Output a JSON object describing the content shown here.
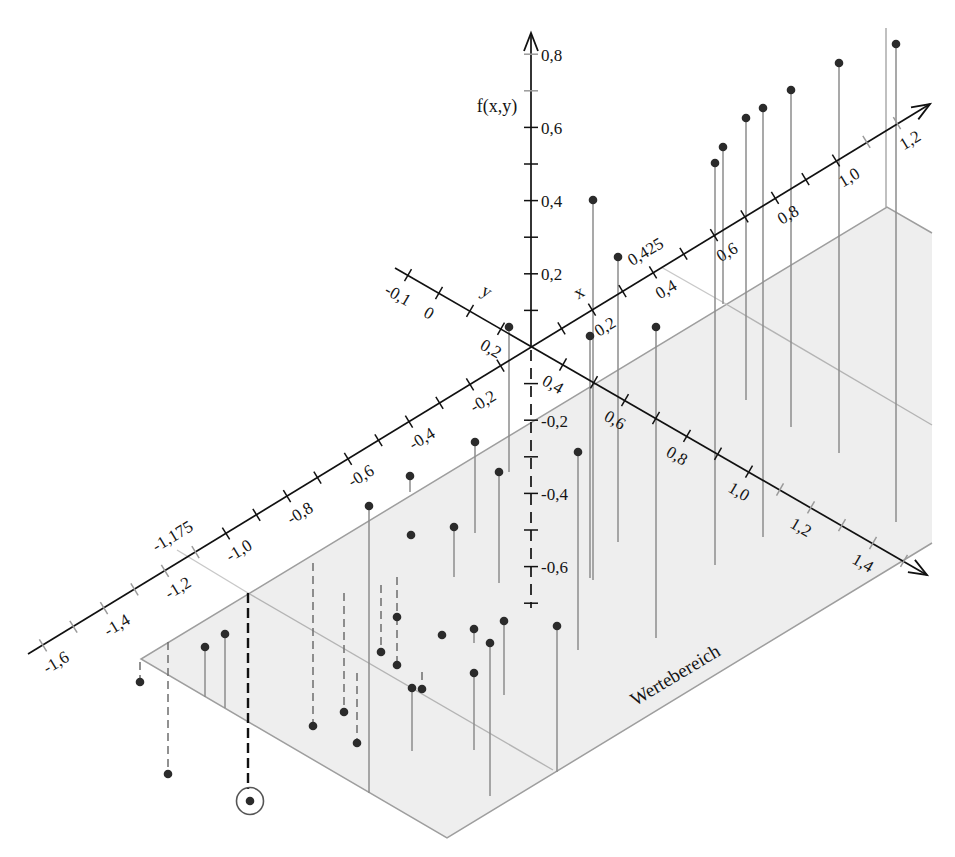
{
  "colors": {
    "background": "#ffffff",
    "plane_fill": "#eeeeee",
    "plane_edge": "#9e9e9e",
    "domain_line": "#b4b4b4",
    "stem": "#8c8c8c",
    "stem_dashed": "#6e6e6e",
    "highlight_stem": "#111111",
    "dot": "#2b2b2b",
    "axis": "#111111",
    "tick_minor": "#9a9a9a",
    "highlight_ring": "#555555"
  },
  "chart_data": {
    "type": "scatter",
    "subtype": "3d-stem",
    "title": "",
    "xlabel": "x",
    "ylabel": "y",
    "zlabel": "f(x,y)",
    "grid": false,
    "legend": null,
    "axes": {
      "x": {
        "label": "x",
        "range": [
          -1.6,
          1.2
        ],
        "tick_step": 0.1,
        "labels": [
          {
            "v": -1.6,
            "t": "-1,6"
          },
          {
            "v": -1.4,
            "t": "-1,4"
          },
          {
            "v": -1.2,
            "t": "-1,2"
          },
          {
            "v": -1.0,
            "t": "-1,0"
          },
          {
            "v": -0.8,
            "t": "-0,8"
          },
          {
            "v": -0.6,
            "t": "-0,6"
          },
          {
            "v": -0.4,
            "t": "-0,4"
          },
          {
            "v": -0.2,
            "t": "-0,2"
          },
          {
            "v": 0.2,
            "t": "0,2"
          },
          {
            "v": 0.4,
            "t": "0,4"
          },
          {
            "v": 0.6,
            "t": "0,6"
          },
          {
            "v": 0.8,
            "t": "0,8"
          },
          {
            "v": 1.0,
            "t": "1,0"
          },
          {
            "v": 1.2,
            "t": "1,2"
          }
        ],
        "marked": [
          {
            "v": -1.175,
            "t": "-1,175"
          },
          {
            "v": 0.425,
            "t": "0,425"
          }
        ]
      },
      "y": {
        "label": "y",
        "range": [
          -0.1,
          1.5
        ],
        "tick_step": 0.1,
        "labels": [
          {
            "v": -0.1,
            "t": "-0,1"
          },
          {
            "v": 0.0,
            "t": "0"
          },
          {
            "v": 0.2,
            "t": "0,2"
          },
          {
            "v": 0.4,
            "t": "0,4"
          },
          {
            "v": 0.6,
            "t": "0,6"
          },
          {
            "v": 0.8,
            "t": "0,8"
          },
          {
            "v": 1.0,
            "t": "1,0"
          },
          {
            "v": 1.2,
            "t": "1,2"
          },
          {
            "v": 1.4,
            "t": "1,4"
          }
        ]
      },
      "f": {
        "label": "f(x,y)",
        "range": [
          -0.7,
          0.8
        ],
        "tick_step": 0.1,
        "labels": [
          {
            "v": 0.8,
            "t": "0,8"
          },
          {
            "v": 0.6,
            "t": "0,6"
          },
          {
            "v": 0.4,
            "t": "0,4"
          },
          {
            "v": 0.2,
            "t": "0,2"
          },
          {
            "v": -0.2,
            "t": "-0,2"
          },
          {
            "v": -0.4,
            "t": "-0,4"
          },
          {
            "v": -0.6,
            "t": "-0,6"
          }
        ]
      }
    },
    "plane_label": "Wertebereich",
    "marked_x_interval": [
      -1.175,
      0.425
    ],
    "points": [
      {
        "cx": 593,
        "cy": 200,
        "y_end": 580,
        "stem": "solid",
        "approx_stem_f": 1.04
      },
      {
        "cx": 590,
        "cy": 336,
        "y_end": 578,
        "stem": "solid",
        "approx_stem_f": 0.66
      },
      {
        "cx": 618,
        "cy": 257,
        "y_end": 542,
        "stem": "solid",
        "approx_stem_f": 0.78
      },
      {
        "cx": 656,
        "cy": 327,
        "y_end": 638,
        "stem": "solid",
        "approx_stem_f": 0.85
      },
      {
        "cx": 715,
        "cy": 163,
        "y_end": 565,
        "stem": "solid",
        "approx_stem_f": 1.1
      },
      {
        "cx": 723,
        "cy": 147,
        "y_end": 304,
        "stem": "solid",
        "approx_stem_f": 0.43
      },
      {
        "cx": 746,
        "cy": 118,
        "y_end": 400,
        "stem": "solid",
        "approx_stem_f": 0.77
      },
      {
        "cx": 763,
        "cy": 108,
        "y_end": 537,
        "stem": "solid",
        "approx_stem_f": 1.17
      },
      {
        "cx": 791,
        "cy": 90,
        "y_end": 427,
        "stem": "solid",
        "approx_stem_f": 0.92
      },
      {
        "cx": 839,
        "cy": 63,
        "y_end": 453,
        "stem": "solid",
        "approx_stem_f": 1.07
      },
      {
        "cx": 896,
        "cy": 44,
        "y_end": 522,
        "stem": "solid",
        "approx_stem_f": 1.31
      },
      {
        "cx": 509,
        "cy": 327,
        "y_end": 472,
        "stem": "solid",
        "approx_stem_f": 0.4
      },
      {
        "cx": 475,
        "cy": 442,
        "y_end": 533,
        "stem": "solid",
        "approx_stem_f": 0.25
      },
      {
        "cx": 499,
        "cy": 472,
        "y_end": 583,
        "stem": "solid",
        "approx_stem_f": 0.3
      },
      {
        "cx": 578,
        "cy": 452,
        "y_end": 650,
        "stem": "solid",
        "approx_stem_f": 0.54
      },
      {
        "cx": 410,
        "cy": 476,
        "y_end": 492,
        "stem": "solid",
        "approx_stem_f": 0.04
      },
      {
        "cx": 369,
        "cy": 506,
        "y_end": 793,
        "stem": "solid",
        "approx_stem_f": 0.78
      },
      {
        "cx": 454,
        "cy": 527,
        "y_end": 577,
        "stem": "solid",
        "approx_stem_f": 0.14
      },
      {
        "cx": 557,
        "cy": 626,
        "y_end": 772,
        "stem": "solid",
        "approx_stem_f": 0.4
      },
      {
        "cx": 504,
        "cy": 621,
        "y_end": 695,
        "stem": "solid",
        "approx_stem_f": 0.2
      },
      {
        "cx": 474,
        "cy": 629,
        "y_end": 643,
        "stem": "solid",
        "approx_stem_f": 0.04
      },
      {
        "cx": 490,
        "cy": 643,
        "y_end": 796,
        "stem": "solid",
        "approx_stem_f": 0.42
      },
      {
        "cx": 474,
        "cy": 673,
        "y_end": 750,
        "stem": "solid",
        "approx_stem_f": 0.21
      },
      {
        "cx": 412,
        "cy": 688,
        "y_end": 751,
        "stem": "solid",
        "approx_stem_f": 0.17
      },
      {
        "cx": 205,
        "cy": 647,
        "y_end": 697,
        "stem": "solid",
        "approx_stem_f": 0.14
      },
      {
        "cx": 225,
        "cy": 634,
        "y_end": 708,
        "stem": "solid",
        "approx_stem_f": 0.2
      },
      {
        "cx": 411,
        "cy": 535,
        "stem": "none"
      },
      {
        "cx": 442,
        "cy": 635,
        "stem": "none"
      },
      {
        "cx": 313,
        "cy": 726,
        "y_start": 563,
        "stem": "dashed",
        "approx_stem_f": -0.45
      },
      {
        "cx": 344,
        "cy": 712,
        "y_start": 593,
        "stem": "dashed",
        "approx_stem_f": -0.33
      },
      {
        "cx": 381,
        "cy": 652,
        "y_start": 585,
        "stem": "dashed",
        "approx_stem_f": -0.18
      },
      {
        "cx": 397,
        "cy": 617,
        "y_start": 577,
        "stem": "dashed",
        "approx_stem_f": -0.11
      },
      {
        "cx": 397,
        "cy": 665,
        "y_start": 617,
        "stem": "dashed",
        "approx_stem_f": -0.24
      },
      {
        "cx": 357,
        "cy": 743,
        "y_start": 673,
        "stem": "dashed",
        "approx_stem_f": -0.19
      },
      {
        "cx": 422,
        "cy": 689,
        "y_start": 672,
        "stem": "dashed",
        "approx_stem_f": -0.05
      },
      {
        "cx": 140,
        "cy": 682,
        "y_start": 662,
        "stem": "dashed",
        "approx_stem_f": -0.05
      },
      {
        "cx": 168,
        "cy": 774,
        "y_start": 642,
        "stem": "dashed",
        "approx_stem_f": -0.36
      },
      {
        "cx": 250,
        "cy": 801,
        "x_line": 248,
        "y_start": 593,
        "stem": "dashed-bold",
        "highlight": true,
        "approx_stem_f": -0.57
      }
    ]
  }
}
